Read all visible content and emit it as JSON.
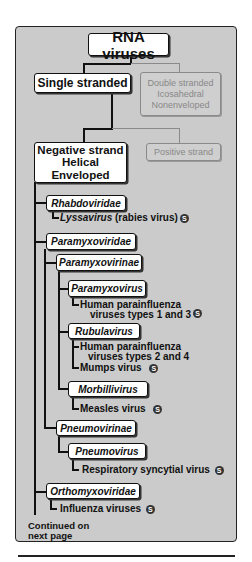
{
  "diagram": {
    "root": "RNA viruses",
    "single_stranded": "Single stranded",
    "double_stranded": [
      "Double stranded",
      "Icosahedral",
      "Nonenveloped"
    ],
    "negative_strand": [
      "Negative strand",
      "Helical",
      "Enveloped"
    ],
    "positive_strand": "Positive strand",
    "families": {
      "rhabdoviridae": {
        "label": "Rhabdoviridae",
        "genus": "Lyssavirus",
        "genus_suffix": " (rabies virus)"
      },
      "paramyxoviridae": {
        "label": "Paramyxoviridae",
        "paramyxovirinae": {
          "label": "Paramyxovirinae",
          "paramyxovirus": {
            "label": "Paramyxovirus",
            "virus_line1": "Human parainfluenza",
            "virus_line2": "viruses types 1 and 3"
          },
          "rubulavirus": {
            "label": "Rubulavirus",
            "virus_line1": "Human parainfluenza",
            "virus_line2": "viruses types 2 and 4",
            "virus2": "Mumps virus"
          },
          "morbillivirus": {
            "label": "Morbillivirus",
            "virus": "Measles virus"
          }
        },
        "pneumovirinae": {
          "label": "Pneumovirinae",
          "pneumovirus": {
            "label": "Pneumovirus",
            "virus": "Respiratory syncytial virus"
          }
        }
      },
      "orthomyxoviridae": {
        "label": "Orthomyxoviridae",
        "virus": "Influenza viruses"
      }
    },
    "continued": [
      "Continued on",
      "next page"
    ],
    "s_icon": "S"
  }
}
